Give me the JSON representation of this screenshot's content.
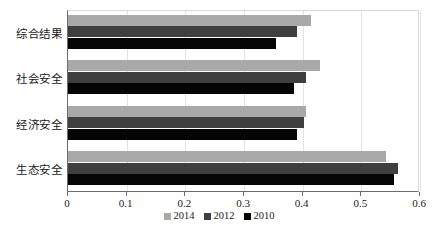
{
  "chart_data": {
    "type": "bar",
    "orientation": "horizontal",
    "title": "",
    "xlabel": "",
    "ylabel": "",
    "categories": [
      "生态安全",
      "经济安全",
      "社会安全",
      "综合结果"
    ],
    "categories_top_to_bottom": [
      "综合结果",
      "社会安全",
      "经济安全",
      "生态安全"
    ],
    "series": [
      {
        "name": "2014",
        "color": "#a9a9a9",
        "values": [
          0.542,
          0.405,
          0.43,
          0.415
        ]
      },
      {
        "name": "2012",
        "color": "#3f3f3f",
        "values": [
          0.562,
          0.402,
          0.405,
          0.39
        ]
      },
      {
        "name": "2010",
        "color": "#050505",
        "values": [
          0.555,
          0.39,
          0.385,
          0.355
        ]
      }
    ],
    "xlim": [
      0,
      0.6
    ],
    "xticks": [
      0,
      0.1,
      0.2,
      0.3,
      0.4,
      0.5,
      0.6
    ],
    "xtick_labels": [
      "0",
      "0.1",
      "0.2",
      "0.3",
      "0.4",
      "0.5",
      "0.6"
    ],
    "grid": true,
    "legend_position": "bottom"
  },
  "axis": {
    "ticks": [
      {
        "value": 0,
        "label": "0"
      },
      {
        "value": 0.1,
        "label": "0.1"
      },
      {
        "value": 0.2,
        "label": "0.2"
      },
      {
        "value": 0.3,
        "label": "0.3"
      },
      {
        "value": 0.4,
        "label": "0.4"
      },
      {
        "value": 0.5,
        "label": "0.5"
      },
      {
        "value": 0.6,
        "label": "0.6"
      }
    ]
  },
  "groups": [
    {
      "label": "综合结果",
      "bars": [
        {
          "series": "2014",
          "value": 0.415
        },
        {
          "series": "2012",
          "value": 0.39
        },
        {
          "series": "2010",
          "value": 0.355
        }
      ]
    },
    {
      "label": "社会安全",
      "bars": [
        {
          "series": "2014",
          "value": 0.43
        },
        {
          "series": "2012",
          "value": 0.405
        },
        {
          "series": "2010",
          "value": 0.385
        }
      ]
    },
    {
      "label": "经济安全",
      "bars": [
        {
          "series": "2014",
          "value": 0.405
        },
        {
          "series": "2012",
          "value": 0.402
        },
        {
          "series": "2010",
          "value": 0.39
        }
      ]
    },
    {
      "label": "生态安全",
      "bars": [
        {
          "series": "2014",
          "value": 0.542
        },
        {
          "series": "2012",
          "value": 0.562
        },
        {
          "series": "2010",
          "value": 0.555
        }
      ]
    }
  ],
  "legend": [
    {
      "label": "2014",
      "color": "#a9a9a9"
    },
    {
      "label": "2012",
      "color": "#3f3f3f"
    },
    {
      "label": "2010",
      "color": "#050505"
    }
  ],
  "caption": ""
}
